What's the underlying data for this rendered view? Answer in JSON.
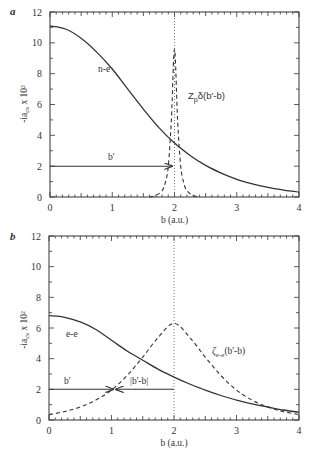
{
  "chart_data": [
    {
      "panel": "a",
      "type": "line",
      "xlabel": "b (a.u.)",
      "ylabel": "-iãᶜₛ x 10²",
      "xlim": [
        0,
        4
      ],
      "ylim": [
        0,
        12
      ],
      "xticks": [
        "0",
        "1",
        "2",
        "3",
        "4"
      ],
      "yticks": [
        "0",
        "2",
        "4",
        "6",
        "8",
        "10",
        "12"
      ],
      "grid": false,
      "vline_x": 2,
      "series": [
        {
          "name": "n-e",
          "style": "solid",
          "x": [
            0,
            0.25,
            0.5,
            0.75,
            1.0,
            1.25,
            1.5,
            1.75,
            2.0,
            2.25,
            2.5,
            2.75,
            3.0,
            3.25,
            3.5,
            3.75,
            4.0
          ],
          "y": [
            11.1,
            10.9,
            10.3,
            9.4,
            8.3,
            7.0,
            5.7,
            4.5,
            3.5,
            2.7,
            2.05,
            1.55,
            1.15,
            0.85,
            0.62,
            0.45,
            0.32
          ]
        },
        {
          "name": "Z_p δ(b'-b)",
          "style": "dashed",
          "x": [
            1.6,
            1.7,
            1.8,
            1.85,
            1.9,
            1.95,
            2.0,
            2.05,
            2.1,
            2.15,
            2.2,
            2.3,
            2.4
          ],
          "y": [
            0.0,
            0.1,
            0.4,
            0.9,
            2.0,
            5.0,
            9.6,
            5.0,
            2.0,
            0.9,
            0.4,
            0.1,
            0.0
          ]
        }
      ],
      "arrows": [
        {
          "label": "b'",
          "from": [
            0,
            2
          ],
          "to": [
            2,
            2
          ]
        }
      ],
      "annotations": [
        "n-e",
        "Z_pδ(b'-b)",
        "b'"
      ]
    },
    {
      "panel": "b",
      "type": "line",
      "xlabel": "b (a.u.)",
      "ylabel": "-iãᶜₛ x 10²",
      "xlim": [
        0,
        4
      ],
      "ylim": [
        0,
        12
      ],
      "xticks": [
        "0",
        "1",
        "2",
        "3",
        "4"
      ],
      "yticks": [
        "0",
        "2",
        "4",
        "6",
        "8",
        "10",
        "12"
      ],
      "grid": false,
      "vline_x": 2,
      "series": [
        {
          "name": "e-e",
          "style": "solid",
          "x": [
            0,
            0.25,
            0.5,
            0.75,
            1.0,
            1.25,
            1.5,
            1.75,
            2.0,
            2.25,
            2.5,
            2.75,
            3.0,
            3.25,
            3.5,
            3.75,
            4.0
          ],
          "y": [
            6.8,
            6.7,
            6.4,
            5.9,
            5.2,
            4.5,
            3.9,
            3.3,
            2.8,
            2.35,
            1.95,
            1.6,
            1.3,
            1.05,
            0.85,
            0.65,
            0.5
          ]
        },
        {
          "name": "ζ_e-e(b'-b)",
          "style": "dashed",
          "x": [
            0,
            0.25,
            0.5,
            0.75,
            1.0,
            1.25,
            1.5,
            1.75,
            2.0,
            2.25,
            2.5,
            2.75,
            3.0,
            3.25,
            3.5,
            3.75,
            4.0
          ],
          "y": [
            0.35,
            0.55,
            0.85,
            1.3,
            1.95,
            2.9,
            4.1,
            5.4,
            6.3,
            5.4,
            4.1,
            2.9,
            1.95,
            1.3,
            0.85,
            0.55,
            0.35
          ]
        }
      ],
      "arrows": [
        {
          "label": "b'",
          "from": [
            0,
            2
          ],
          "to": [
            2,
            2
          ]
        },
        {
          "label": "|b'-b|",
          "from": [
            2,
            2
          ],
          "to": [
            1.05,
            2
          ]
        }
      ],
      "annotations": [
        "e-e",
        "ζ_e-e(b'-b)",
        "b'",
        "|b'-b|"
      ]
    }
  ],
  "labels": {
    "panel_a": "a",
    "panel_b": "b",
    "xlabel": "b (a.u.)",
    "ylabel_main": "-ia",
    "ylabel_tail": " x 10²",
    "a_curve": "n-e",
    "a_delta_main": "Z",
    "a_delta_sub": "p",
    "a_delta_tail": "δ(b'-b)",
    "b_curve": "e-e",
    "b_zeta_main": "ζ",
    "b_zeta_sub": "e-e",
    "b_zeta_tail": "(b'-b)",
    "bprime": "b'",
    "absdiff": "|b'-b|",
    "xticks": [
      "0",
      "1",
      "2",
      "3",
      "4"
    ],
    "yticks": [
      "0",
      "2",
      "4",
      "6",
      "8",
      "10",
      "12"
    ]
  }
}
